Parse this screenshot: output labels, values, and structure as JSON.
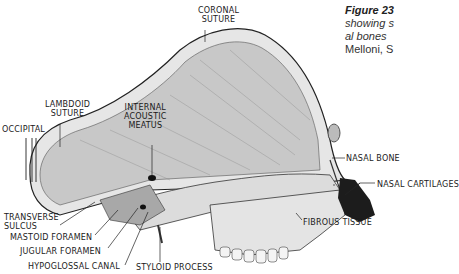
{
  "caption": {
    "figure": "Figure 23",
    "line2": "showing s",
    "line3": "al  bones",
    "line4": "Melloni, S"
  },
  "labels": {
    "coronal": [
      "CORONAL",
      "SUTURE"
    ],
    "lambdoid": [
      "LAMBDOID",
      "SUTURE"
    ],
    "occipital": "OCCIPITAL",
    "internal_acoustic": [
      "INTERNAL",
      "ACOUSTIC",
      "MEATUS"
    ],
    "nasal_bone": "NASAL BONE",
    "nasal_cartilages": "NASAL CARTILAGES",
    "fibrous_tissue": "FIBROUS  TISSUE",
    "transverse_sulcus": [
      "TRANSVERSE",
      "SULCUS"
    ],
    "mastoid_foramen": "MASTOID FORAMEN",
    "jugular_foramen": "JUGULAR  FORAMEN",
    "hypoglossal_canal": "HYPOGLOSSAL  CANAL",
    "styloid_process": "STYLOID PROCESS"
  },
  "colors": {
    "bone": "#d9d9d9",
    "shade": "#9a9a9a",
    "cartilage": "#1c1c1c",
    "line": "#222222"
  }
}
